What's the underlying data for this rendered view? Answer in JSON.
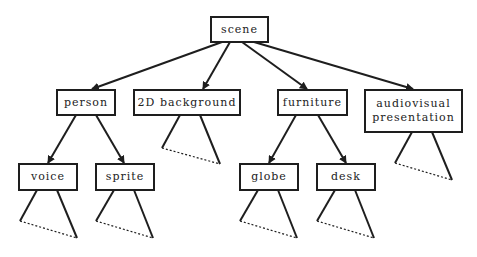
{
  "diagram": {
    "type": "tree",
    "root": {
      "label": "scene",
      "children": [
        {
          "label": "person",
          "children": [
            {
              "label": "voice",
              "collapsed_subtree": true
            },
            {
              "label": "sprite",
              "collapsed_subtree": true
            }
          ]
        },
        {
          "label": "2D background",
          "collapsed_subtree": true
        },
        {
          "label": "furniture",
          "children": [
            {
              "label": "globe",
              "collapsed_subtree": true
            },
            {
              "label": "desk",
              "collapsed_subtree": true
            }
          ]
        },
        {
          "label": "audiovisual presentation",
          "collapsed_subtree": true
        }
      ]
    }
  },
  "nodes": {
    "scene": "scene",
    "person": "person",
    "background": "2D background",
    "furniture": "furniture",
    "av_line1": "audiovisual",
    "av_line2": "presentation",
    "voice": "voice",
    "sprite": "sprite",
    "globe": "globe",
    "desk": "desk"
  },
  "colors": {
    "line": "#1e1e1e",
    "background": "#ffffff"
  }
}
